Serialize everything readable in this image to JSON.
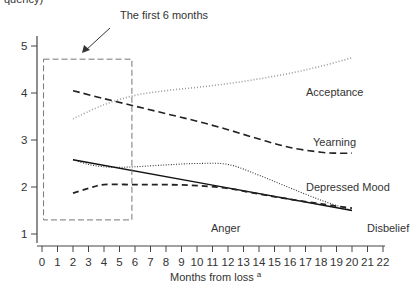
{
  "chart_data": {
    "type": "line",
    "title": "",
    "top_fragment": "quency)",
    "xlabel": "Months from loss",
    "xlabel_superscript": "a",
    "ylabel": "",
    "xlim": [
      0,
      22
    ],
    "ylim": [
      1,
      5
    ],
    "x_ticks": [
      0,
      1,
      2,
      3,
      4,
      5,
      6,
      7,
      8,
      9,
      10,
      11,
      12,
      13,
      14,
      15,
      16,
      17,
      18,
      19,
      20,
      21,
      22
    ],
    "y_ticks": [
      1,
      2,
      3,
      4,
      5
    ],
    "grid": false,
    "legend": "inline labels",
    "annotation": {
      "text": "The first 6 months",
      "box": {
        "x0": 0.1,
        "x1": 5.8,
        "y0": 1.3,
        "y1": 4.72,
        "style": "dashed"
      }
    },
    "series": [
      {
        "name": "Acceptance",
        "style": "dotted-gray",
        "x": [
          2,
          4,
          6,
          8,
          10,
          12,
          14,
          16,
          18,
          20
        ],
        "values": [
          3.45,
          3.75,
          3.95,
          4.05,
          4.12,
          4.2,
          4.3,
          4.42,
          4.57,
          4.75
        ]
      },
      {
        "name": "Yearning",
        "style": "dashed-long",
        "x": [
          2,
          4,
          6,
          8,
          10,
          12,
          14,
          16,
          18,
          19,
          20
        ],
        "values": [
          4.05,
          3.88,
          3.72,
          3.56,
          3.4,
          3.22,
          3.02,
          2.84,
          2.74,
          2.72,
          2.72
        ]
      },
      {
        "name": "Depressed Mood",
        "style": "dotted-fine",
        "x": [
          2,
          3,
          4,
          5,
          6,
          8,
          10,
          12,
          14,
          16,
          18,
          20
        ],
        "values": [
          2.58,
          2.48,
          2.43,
          2.42,
          2.43,
          2.47,
          2.5,
          2.48,
          2.25,
          1.98,
          1.72,
          1.5
        ]
      },
      {
        "name": "Disbelief",
        "style": "solid",
        "x": [
          2,
          20
        ],
        "values": [
          2.58,
          1.5
        ]
      },
      {
        "name": "Anger",
        "style": "dashed",
        "x": [
          2,
          3,
          4,
          6,
          8,
          10,
          12,
          14,
          16,
          18,
          20
        ],
        "values": [
          1.87,
          1.97,
          2.05,
          2.05,
          2.05,
          2.03,
          1.97,
          1.85,
          1.74,
          1.64,
          1.55
        ]
      }
    ]
  },
  "labels": {
    "annotation": "The first 6 months",
    "acceptance": "Acceptance",
    "yearning": "Yearning",
    "depressed": "Depressed Mood",
    "anger": "Anger",
    "disbelief": "Disbelief",
    "xlabel": "Months from loss",
    "xlabel_sup": "a",
    "top_fragment": "quency)"
  }
}
